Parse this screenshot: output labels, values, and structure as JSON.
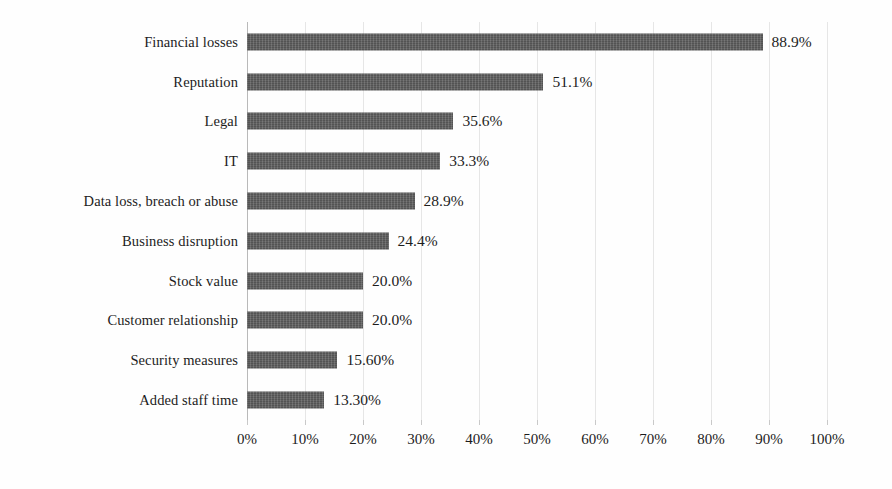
{
  "chart_data": {
    "type": "bar",
    "orientation": "horizontal",
    "title": "",
    "subtitle": "",
    "xlabel": "",
    "ylabel": "",
    "xlim": [
      0,
      100
    ],
    "grid": true,
    "legend": null,
    "categories": [
      "Financial losses",
      "Reputation",
      "Legal",
      "IT",
      "Data loss, breach or abuse",
      "Business disruption",
      "Stock value",
      "Customer relationship",
      "Security measures",
      "Added staff time"
    ],
    "values": [
      88.9,
      51.1,
      35.6,
      33.3,
      28.9,
      24.4,
      20.0,
      20.0,
      15.6,
      13.3
    ],
    "value_labels": [
      "88.9%",
      "51.1%",
      "35.6%",
      "33.3%",
      "28.9%",
      "24.4%",
      "20.0%",
      "20.0%",
      "15.60%",
      "13.30%"
    ],
    "xticks": [
      0,
      10,
      20,
      30,
      40,
      50,
      60,
      70,
      80,
      90,
      100
    ],
    "xtick_labels": [
      "0%",
      "10%",
      "20%",
      "30%",
      "40%",
      "50%",
      "60%",
      "70%",
      "80%",
      "90%",
      "100%"
    ],
    "bar_color": "#5d5d5d",
    "gridline_color": "#e6e6e6",
    "axis_color": "#b9b9b9",
    "background_color": "#fefefe",
    "text_color": "#1c1c1c"
  }
}
